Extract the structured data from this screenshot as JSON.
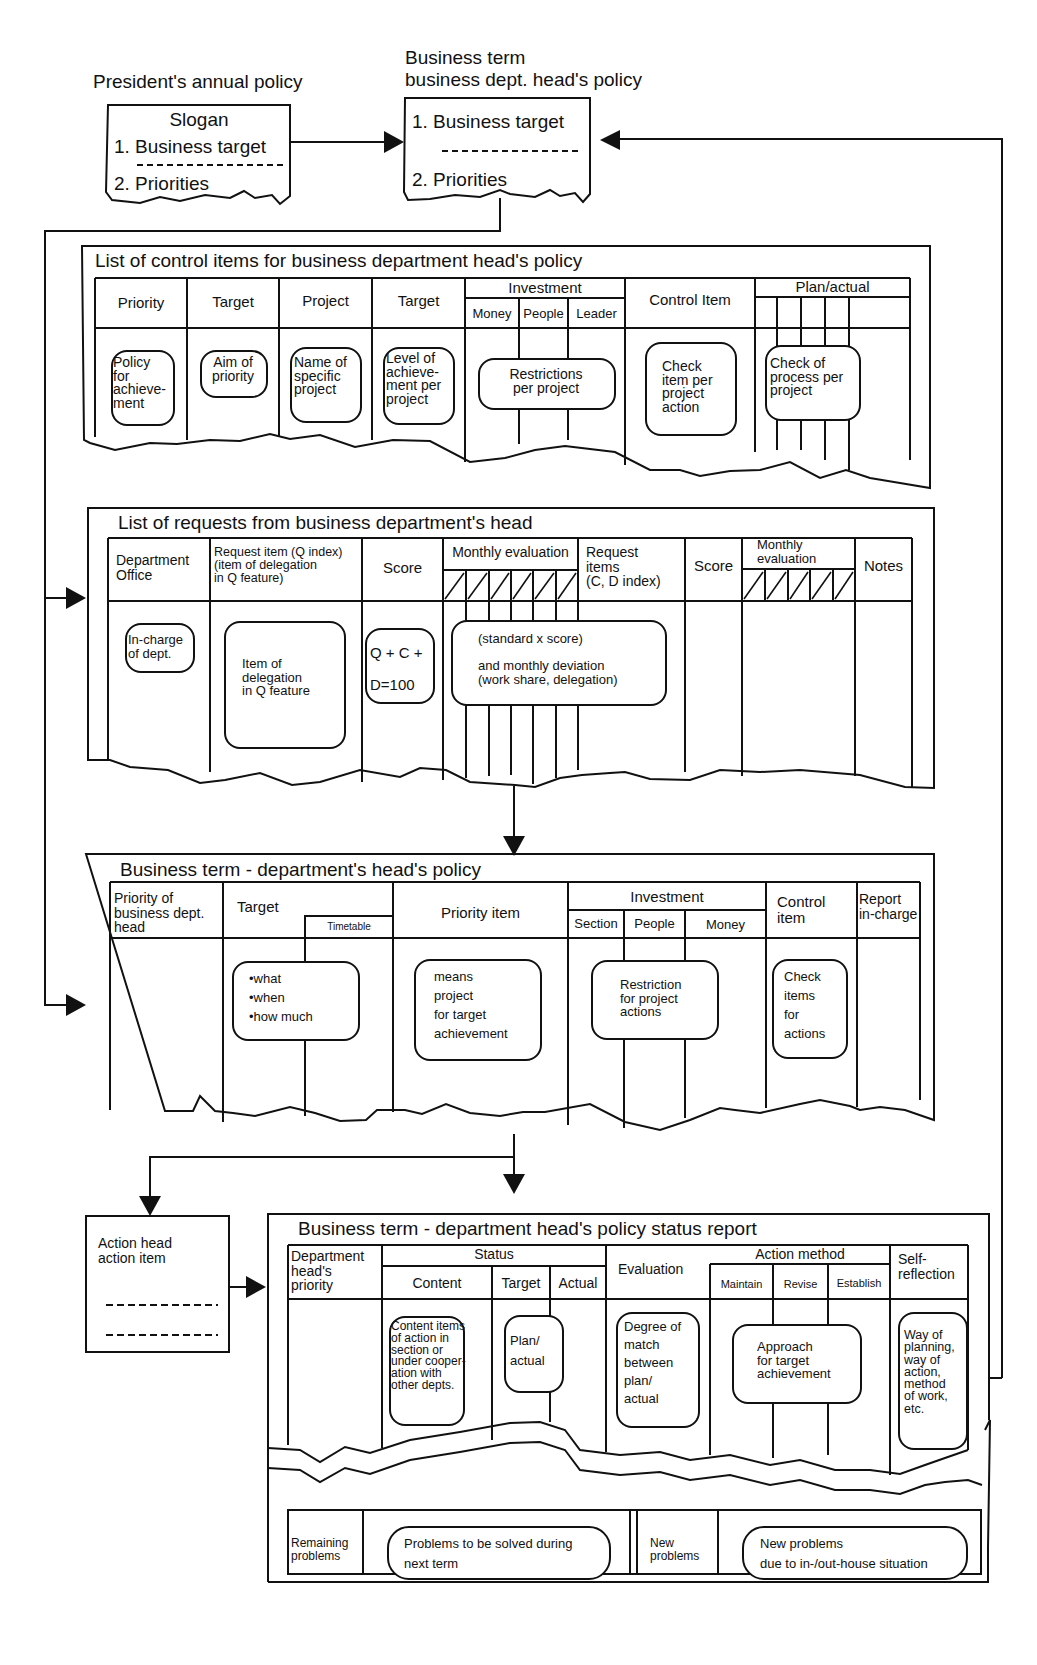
{
  "top": {
    "president_title": "President's annual policy",
    "president_box": {
      "slogan": "Slogan",
      "item1": "1. Business target",
      "item2": "2. Priorities"
    },
    "dept_title_line1": "Business term",
    "dept_title_line2": "business dept. head's policy",
    "dept_box": {
      "item1": "1. Business target",
      "item2": "2. Priorities"
    }
  },
  "control_items": {
    "title": "List of control items for business department head's policy",
    "headers": {
      "priority": "Priority",
      "target1": "Target",
      "project": "Project",
      "target2": "Target",
      "investment": "Investment",
      "money": "Money",
      "people": "People",
      "leader": "Leader",
      "control_item": "Control Item",
      "plan_actual": "Plan/actual"
    },
    "bubbles": {
      "priority": "Policy\nfor\nachieve-\nment",
      "target1": "Aim of\npriority",
      "project": "Name of\nspecific\nproject",
      "target2": "Level of\nachieve-\nment per\nproject",
      "investment": "Restrictions\nper project",
      "control_item": "Check\nitem per\nproject\naction",
      "plan_actual": "Check of\nprocess per\nproject"
    }
  },
  "requests": {
    "title": "List of requests from business department's head",
    "headers": {
      "dept_office": "Department\nOffice",
      "request_q": "Request item (Q index)\n(item of delegation\nin Q feature)",
      "score1": "Score",
      "monthly1": "Monthly evaluation",
      "request_cd": "Request\nitems\n(C, D index)",
      "score2": "Score",
      "monthly2": "Monthly\nevaluation",
      "notes": "Notes"
    },
    "bubbles": {
      "dept_office": "In-charge\nof dept.",
      "request_q": "Item of\ndelegation\nin Q feature",
      "score": "Q + C +\n\nD=100",
      "monthly": "(standard  x  score)\n\nand monthly deviation\n(work share, delegation)"
    }
  },
  "dept_policy": {
    "title": "Business term - department's head's policy",
    "headers": {
      "priority": "Priority of\nbusiness dept.\nhead",
      "target": "Target",
      "timetable": "Timetable",
      "priority_item": "Priority item",
      "investment": "Investment",
      "section": "Section",
      "people": "People",
      "money": "Money",
      "control_item": "Control\nitem",
      "report": "Report\nin-charge"
    },
    "bubbles": {
      "target": "•what\n•when\n•how much",
      "priority_item": "means\nproject\nfor target\nachievement",
      "investment": "Restriction\nfor project\nactions",
      "control_item": "Check\nitems\nfor\nactions"
    }
  },
  "action_head": {
    "label": "Action head\naction item"
  },
  "status_report": {
    "title": "Business term - department head's policy status report",
    "headers": {
      "priority": "Department\nhead's\npriority",
      "status": "Status",
      "content": "Content",
      "target": "Target",
      "actual": "Actual",
      "evaluation": "Evaluation",
      "action_method": "Action method",
      "maintain": "Maintain",
      "revise": "Revise",
      "establish": "Establish",
      "self_reflection": "Self-\nreflection"
    },
    "bubbles": {
      "content": "Content items\nof action in\nsection or\nunder cooper-\nation with\nother depts.",
      "plan_actual": "Plan/\n    actual",
      "evaluation": "Degree of\nmatch\nbetween\nplan/\nactual",
      "approach": "Approach\nfor target\nachievement",
      "self_reflection": "Way of\nplanning,\nway of\naction,\nmethod\nof work,\netc."
    },
    "footer": {
      "remaining_label": "Remaining\nproblems",
      "remaining_text": "Problems to be solved during\nnext term",
      "new_label": "New\nproblems",
      "new_text": "New problems\ndue to in-/out-house situation"
    }
  }
}
